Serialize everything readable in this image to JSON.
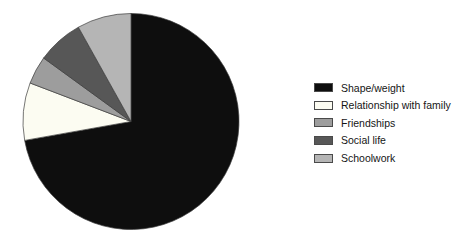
{
  "background_color": "#ffffff",
  "chart_data": {
    "type": "pie",
    "title": "",
    "legend_position": "right",
    "start_angle_deg": 0,
    "direction": "clockwise",
    "center": {
      "cx": 131,
      "cy": 121.5,
      "r": 108
    },
    "stroke_color": "#3c3c3c",
    "stroke_width": 0.7,
    "slices": [
      {
        "label": "Shape/weight",
        "value": 72.2,
        "color": "#0e0e0e"
      },
      {
        "label": "Relationship with family",
        "value": 8.6,
        "color": "#fcfcf2"
      },
      {
        "label": "Friendships",
        "value": 4.2,
        "color": "#9d9d9d"
      },
      {
        "label": "Social life",
        "value": 6.9,
        "color": "#575757"
      },
      {
        "label": "Schoolwork",
        "value": 8.1,
        "color": "#b5b5b5"
      }
    ]
  }
}
